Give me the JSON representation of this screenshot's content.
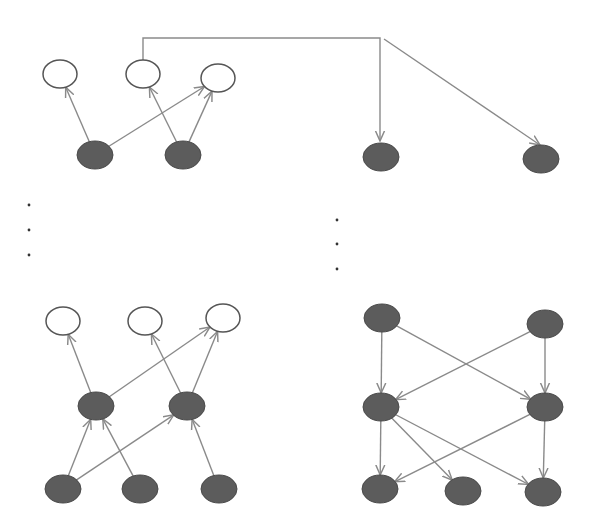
{
  "diagram": {
    "title": "",
    "colors": {
      "hidden_fill": "#5c5c5c",
      "visible_fill": "#ffffff",
      "edge": "#8a8a8a",
      "ellipsis_dot": "#333333"
    },
    "panels": [
      {
        "id": "top-left",
        "description": "Two shaded latent nodes feeding three observed (white) nodes",
        "nodes": [
          {
            "id": "tl-v1",
            "type": "visible",
            "cx": 60,
            "cy": 74
          },
          {
            "id": "tl-v2",
            "type": "visible",
            "cx": 143,
            "cy": 74
          },
          {
            "id": "tl-v3",
            "type": "visible",
            "cx": 218,
            "cy": 78
          },
          {
            "id": "tl-h1",
            "type": "hidden",
            "cx": 95,
            "cy": 155
          },
          {
            "id": "tl-h2",
            "type": "hidden",
            "cx": 183,
            "cy": 155
          }
        ],
        "edges": [
          {
            "from": "tl-h1",
            "to": "tl-v1"
          },
          {
            "from": "tl-h1",
            "to": "tl-v3"
          },
          {
            "from": "tl-h2",
            "to": "tl-v2"
          },
          {
            "from": "tl-h2",
            "to": "tl-v3"
          }
        ]
      },
      {
        "id": "top-right",
        "description": "Two shaded nodes receiving a connector from the top-left panel",
        "nodes": [
          {
            "id": "tr-h1",
            "type": "hidden",
            "cx": 381,
            "cy": 157
          },
          {
            "id": "tr-h2",
            "type": "hidden",
            "cx": 541,
            "cy": 159
          }
        ],
        "edges": [
          {
            "from": "tl-v2",
            "to": "tr-h1",
            "routing": "elbow"
          },
          {
            "from": "tl-v2",
            "to": "tr-h2",
            "routing": "elbow-diagonal"
          }
        ]
      },
      {
        "id": "bottom-left",
        "description": "Three-layer network: 3 shaded bottom, 2 shaded middle, 3 observed top",
        "nodes": [
          {
            "id": "bl-v1",
            "type": "visible",
            "cx": 63,
            "cy": 321
          },
          {
            "id": "bl-v2",
            "type": "visible",
            "cx": 145,
            "cy": 321
          },
          {
            "id": "bl-v3",
            "type": "visible",
            "cx": 223,
            "cy": 318
          },
          {
            "id": "bl-m1",
            "type": "hidden",
            "cx": 96,
            "cy": 406
          },
          {
            "id": "bl-m2",
            "type": "hidden",
            "cx": 187,
            "cy": 406
          },
          {
            "id": "bl-b1",
            "type": "hidden",
            "cx": 63,
            "cy": 489
          },
          {
            "id": "bl-b2",
            "type": "hidden",
            "cx": 140,
            "cy": 489
          },
          {
            "id": "bl-b3",
            "type": "hidden",
            "cx": 219,
            "cy": 489
          }
        ],
        "edges": [
          {
            "from": "bl-m1",
            "to": "bl-v1"
          },
          {
            "from": "bl-m1",
            "to": "bl-v3"
          },
          {
            "from": "bl-m2",
            "to": "bl-v2"
          },
          {
            "from": "bl-m2",
            "to": "bl-v3"
          },
          {
            "from": "bl-b1",
            "to": "bl-m1"
          },
          {
            "from": "bl-b1",
            "to": "bl-m2"
          },
          {
            "from": "bl-b2",
            "to": "bl-m1"
          },
          {
            "from": "bl-b3",
            "to": "bl-m2"
          }
        ]
      },
      {
        "id": "bottom-right",
        "description": "Top-down network: 2 shaded top, 2 shaded middle, 3 shaded bottom",
        "nodes": [
          {
            "id": "br-t1",
            "type": "hidden",
            "cx": 382,
            "cy": 318
          },
          {
            "id": "br-t2",
            "type": "hidden",
            "cx": 545,
            "cy": 324
          },
          {
            "id": "br-m1",
            "type": "hidden",
            "cx": 381,
            "cy": 407
          },
          {
            "id": "br-m2",
            "type": "hidden",
            "cx": 545,
            "cy": 407
          },
          {
            "id": "br-b1",
            "type": "hidden",
            "cx": 380,
            "cy": 489
          },
          {
            "id": "br-b2",
            "type": "hidden",
            "cx": 463,
            "cy": 491
          },
          {
            "id": "br-b3",
            "type": "hidden",
            "cx": 543,
            "cy": 492
          }
        ],
        "edges": [
          {
            "from": "br-t1",
            "to": "br-m1"
          },
          {
            "from": "br-t1",
            "to": "br-m2"
          },
          {
            "from": "br-t2",
            "to": "br-m1"
          },
          {
            "from": "br-t2",
            "to": "br-m2"
          },
          {
            "from": "br-m1",
            "to": "br-b1"
          },
          {
            "from": "br-m1",
            "to": "br-b2"
          },
          {
            "from": "br-m1",
            "to": "br-b3"
          },
          {
            "from": "br-m2",
            "to": "br-b1"
          },
          {
            "from": "br-m2",
            "to": "br-b3"
          }
        ]
      }
    ],
    "ellipses": [
      {
        "id": "left-vertical-ellipsis",
        "dots": [
          [
            29,
            205
          ],
          [
            29,
            230
          ],
          [
            29,
            255
          ]
        ]
      },
      {
        "id": "right-vertical-ellipsis",
        "dots": [
          [
            337,
            220
          ],
          [
            337,
            244
          ],
          [
            337,
            269
          ]
        ]
      }
    ]
  }
}
